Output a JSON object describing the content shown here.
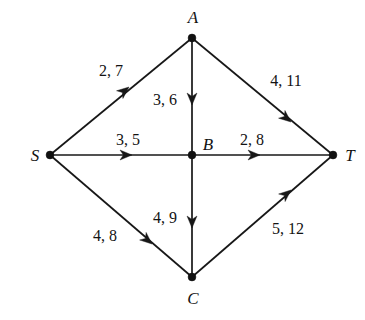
{
  "figure": {
    "kind": "flow-network-diagram",
    "width": 365,
    "height": 320,
    "background_color": "#ffffff",
    "ink_color": "#131313"
  },
  "nodes": [
    {
      "id": "S",
      "label": "S",
      "x": 50,
      "y": 155,
      "label_x": 35,
      "label_y": 155
    },
    {
      "id": "A",
      "label": "A",
      "x": 192,
      "y": 38,
      "label_x": 193,
      "label_y": 17
    },
    {
      "id": "B",
      "label": "B",
      "x": 192,
      "y": 155,
      "label_x": 208,
      "label_y": 144
    },
    {
      "id": "C",
      "label": "C",
      "x": 192,
      "y": 277,
      "label_x": 193,
      "label_y": 298
    },
    {
      "id": "T",
      "label": "T",
      "x": 333,
      "y": 155,
      "label_x": 350,
      "label_y": 155
    }
  ],
  "edges": [
    {
      "id": "S-A",
      "from": "S",
      "to": "A",
      "label": "2, 7",
      "label_x": 111,
      "label_y": 71,
      "arrow_x": 129,
      "arrow_y": 87,
      "arrow_angle": -39.5
    },
    {
      "id": "A-T",
      "from": "A",
      "to": "T",
      "label": "4, 11",
      "label_x": 286,
      "label_y": 81,
      "arrow_x": 291,
      "arrow_y": 122,
      "arrow_angle": 39.7
    },
    {
      "id": "A-B",
      "from": "A",
      "to": "B",
      "label": "3, 6",
      "label_x": 165,
      "label_y": 100,
      "arrow_x": 192,
      "arrow_y": 105,
      "arrow_angle": 90
    },
    {
      "id": "S-B",
      "from": "S",
      "to": "B",
      "label": "3, 5",
      "label_x": 128,
      "label_y": 140,
      "arrow_x": 132,
      "arrow_y": 155,
      "arrow_angle": 0
    },
    {
      "id": "B-T",
      "from": "B",
      "to": "T",
      "label": "2, 8",
      "label_x": 252,
      "label_y": 140,
      "arrow_x": 260,
      "arrow_y": 155,
      "arrow_angle": 0
    },
    {
      "id": "S-C",
      "from": "S",
      "to": "C",
      "label": "4, 8",
      "label_x": 105,
      "label_y": 236,
      "arrow_x": 152,
      "arrow_y": 244,
      "arrow_angle": 40.5
    },
    {
      "id": "B-C",
      "from": "B",
      "to": "C",
      "label": "4, 9",
      "label_x": 165,
      "label_y": 218,
      "arrow_x": 192,
      "arrow_y": 228,
      "arrow_angle": 90
    },
    {
      "id": "C-T",
      "from": "C",
      "to": "T",
      "label": "5, 12",
      "label_x": 288,
      "label_y": 229,
      "arrow_x": 291,
      "arrow_y": 190,
      "arrow_angle": -40.5
    }
  ]
}
